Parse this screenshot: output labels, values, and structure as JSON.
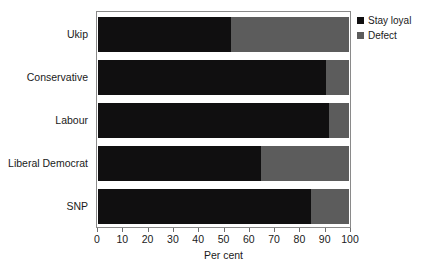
{
  "chart_data": {
    "type": "bar",
    "orientation": "horizontal",
    "stacked": true,
    "title": "",
    "subtitle": "",
    "xlabel": "Per cent",
    "ylabel": "",
    "xlim": [
      0,
      100
    ],
    "xticks": [
      0,
      10,
      20,
      30,
      40,
      50,
      60,
      70,
      80,
      90,
      100
    ],
    "xtick_labels": [
      "0",
      "10",
      "20",
      "30",
      "40",
      "50",
      "60",
      "70",
      "80",
      "90",
      "100"
    ],
    "grid": false,
    "legend_position": "top-right",
    "categories": [
      "Ukip",
      "Conservative",
      "Labour",
      "Liberal Democrat",
      "SNP"
    ],
    "series": [
      {
        "name": "Stay loyal",
        "color": "#100f10",
        "values": [
          53,
          91,
          92,
          65,
          85
        ]
      },
      {
        "name": "Defect",
        "color": "#5c5c5c",
        "values": [
          47,
          9,
          8,
          35,
          15
        ]
      }
    ]
  },
  "legend": {
    "items": [
      {
        "label": "Stay loyal",
        "color": "#100f10"
      },
      {
        "label": "Defect",
        "color": "#5c5c5c"
      }
    ]
  },
  "axis": {
    "x_title": "Per cent"
  },
  "colors": {
    "stay_loyal": "#100f10",
    "defect": "#5c5c5c",
    "frame": "#8a8a8a",
    "background": "#ffffff",
    "text": "#1a1a1a"
  }
}
